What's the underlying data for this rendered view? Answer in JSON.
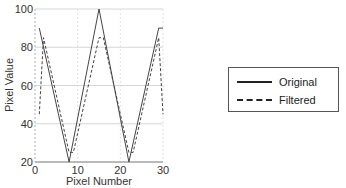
{
  "chart_data": {
    "type": "line",
    "title": "",
    "xlabel": "Pixel Number",
    "ylabel": "Pixel Value",
    "xlim": [
      0,
      30
    ],
    "ylim": [
      20,
      100
    ],
    "xticks": [
      0,
      10,
      20,
      30
    ],
    "yticks": [
      20,
      40,
      60,
      80,
      100
    ],
    "grid": true,
    "legend_position": "right-outside",
    "series": [
      {
        "name": "Original",
        "style": "solid",
        "x": [
          1,
          8,
          15,
          22,
          29,
          30
        ],
        "y": [
          90,
          20,
          100,
          20,
          90,
          90
        ]
      },
      {
        "name": "Filtered",
        "style": "dashed",
        "x": [
          1,
          2,
          8,
          8.5,
          9,
          15,
          16,
          22,
          22.5,
          23,
          29,
          30
        ],
        "y": [
          45,
          85,
          25,
          25,
          25,
          85,
          85,
          25,
          25,
          25,
          85,
          45
        ]
      }
    ]
  },
  "axes": {
    "xlabel": "Pixel Number",
    "ylabel": "Pixel Value",
    "xtick_labels": [
      "0",
      "10",
      "20",
      "30"
    ],
    "ytick_labels": [
      "20",
      "40",
      "60",
      "80",
      "100"
    ]
  },
  "legend": {
    "items": [
      {
        "label": "Original",
        "style": "solid"
      },
      {
        "label": "Filtered",
        "style": "dashed"
      }
    ]
  }
}
